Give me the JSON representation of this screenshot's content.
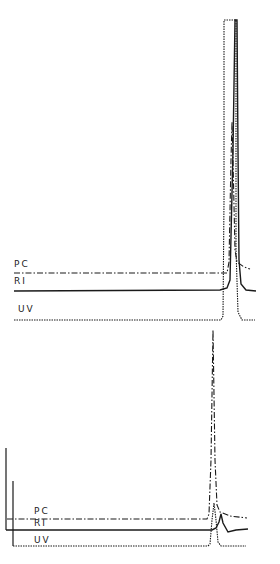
{
  "chart_data": [
    {
      "type": "line",
      "title": "",
      "xlabel": "",
      "ylabel": "",
      "grid": false,
      "legend": "inline labels at left of each trace",
      "series": [
        {
          "name": "PC",
          "style": "dash-dot",
          "label_pos": [
            14,
            267
          ],
          "points": [
            [
              14,
              273
            ],
            [
              227,
              273
            ],
            [
              229,
              262
            ],
            [
              231,
              160
            ],
            [
              232,
              122
            ],
            [
              233,
              160
            ],
            [
              235,
              250
            ],
            [
              237,
              262
            ],
            [
              244,
              267
            ],
            [
              250,
              269
            ]
          ]
        },
        {
          "name": "RI",
          "style": "solid",
          "label_pos": [
            14,
            284
          ],
          "points": [
            [
              14,
              291
            ],
            [
              220,
              290
            ],
            [
              227,
              288
            ],
            [
              230,
              280
            ],
            [
              233,
              150
            ],
            [
              235,
              20
            ],
            [
              237,
              20
            ],
            [
              238,
              150
            ],
            [
              239,
              260
            ],
            [
              241,
              284
            ],
            [
              246,
              290
            ],
            [
              256,
              291
            ]
          ]
        },
        {
          "name": "UV",
          "style": "dotted",
          "label_pos": [
            18,
            312
          ],
          "points": [
            [
              14,
              320
            ],
            [
              221,
              320
            ],
            [
              223,
              316
            ],
            [
              224,
              200
            ],
            [
              224,
              20
            ],
            [
              236,
              20
            ],
            [
              236,
              250
            ],
            [
              238,
              312
            ],
            [
              242,
              320
            ],
            [
              255,
              320
            ]
          ]
        }
      ],
      "note": "Upper chromatogram: UV and RI peaks off-scale (flat top), PC peak at ~half height"
    },
    {
      "type": "line",
      "title": "",
      "xlabel": "",
      "ylabel": "",
      "grid": false,
      "legend": "inline labels at left of each trace",
      "axes": [
        {
          "x": 6,
          "y_top": 448,
          "y_bottom": 530
        },
        {
          "x": 13,
          "y_top": 481,
          "y_bottom": 546
        }
      ],
      "series": [
        {
          "name": "PC",
          "style": "dash-dot",
          "label_pos": [
            34,
            514
          ],
          "points": [
            [
              7,
              519
            ],
            [
              207,
              519
            ],
            [
              209,
              514
            ],
            [
              211,
              460
            ],
            [
              213,
              330
            ],
            [
              215,
              460
            ],
            [
              217,
              505
            ],
            [
              220,
              512
            ],
            [
              230,
              516
            ],
            [
              247,
              518
            ]
          ]
        },
        {
          "name": "RI",
          "style": "solid",
          "label_pos": [
            34,
            526
          ],
          "points": [
            [
              6,
              530
            ],
            [
              212,
              530
            ],
            [
              216,
              528
            ],
            [
              219,
              522
            ],
            [
              221,
              514
            ],
            [
              223,
              523
            ],
            [
              228,
              532
            ],
            [
              236,
              530
            ],
            [
              248,
              529
            ]
          ]
        },
        {
          "name": "UV",
          "style": "dotted",
          "label_pos": [
            34,
            543
          ],
          "points": [
            [
              13,
              546
            ],
            [
              208,
              546
            ],
            [
              210,
              544
            ],
            [
              212,
              520
            ],
            [
              214,
              503
            ],
            [
              216,
              520
            ],
            [
              218,
              542
            ],
            [
              221,
              546
            ],
            [
              246,
              546
            ]
          ]
        }
      ],
      "note": "Lower chromatogram: PC dominant peak, small RI bump, UV peak at same retention"
    }
  ]
}
